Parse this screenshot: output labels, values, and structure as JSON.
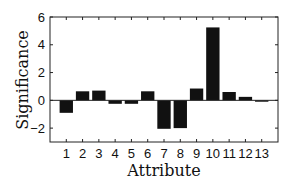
{
  "chart_data": {
    "type": "bar",
    "title": "",
    "xlabel": "Attribute",
    "ylabel": "Significance",
    "categories": [
      "1",
      "2",
      "3",
      "4",
      "5",
      "6",
      "7",
      "8",
      "9",
      "10",
      "11",
      "12",
      "13"
    ],
    "values": [
      -0.9,
      0.65,
      0.7,
      -0.25,
      -0.25,
      0.65,
      -2.05,
      -2.0,
      0.85,
      5.25,
      0.6,
      0.25,
      -0.1
    ],
    "ylim": [
      -3,
      6
    ],
    "yticks": [
      -2,
      0,
      2,
      4,
      6
    ],
    "ytick_labels": [
      "−2",
      "0",
      "2",
      "4",
      "6"
    ],
    "grid": false,
    "legend": null,
    "bar_color": "#111111",
    "zero_line": true
  }
}
